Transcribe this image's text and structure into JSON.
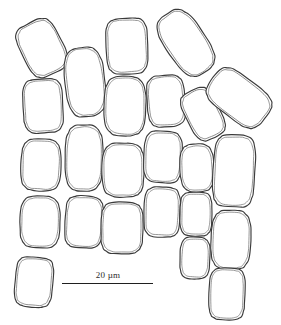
{
  "figure": {
    "kind": "line-drawing-micrograph",
    "background_color": "#ffffff",
    "outline_color": "#3a3a3a",
    "inner_outline_color": "#6e6e6e",
    "width_px": 281,
    "height_px": 325
  },
  "scalebar": {
    "label": "20 µm",
    "value": 20,
    "unit": "µm",
    "bar_length_px": 91,
    "line_color": "#1f1f1f"
  },
  "caption": {
    "left_fragment": "",
    "right_fragment": ""
  },
  "chart_data": {
    "type": "scatter",
    "title": "",
    "xlabel": "",
    "ylabel": "",
    "grid": false,
    "legend": null,
    "xlim": [
      0,
      281
    ],
    "ylim": [
      0,
      325
    ],
    "annotations": [
      "20 µm"
    ],
    "chains": [
      {
        "name": "chain-1",
        "cell_count": 5,
        "cells": [
          {
            "id": "c1-1",
            "cx": 42,
            "cy": 48,
            "rx": 21,
            "ry": 28,
            "rot": -26
          },
          {
            "id": "c1-2",
            "cx": 43,
            "cy": 106,
            "rx": 20,
            "ry": 27,
            "rot": -3
          },
          {
            "id": "c1-3",
            "cx": 41,
            "cy": 165,
            "rx": 20,
            "ry": 26,
            "rot": 2
          },
          {
            "id": "c1-4",
            "cx": 40,
            "cy": 222,
            "rx": 20,
            "ry": 26,
            "rot": 1
          },
          {
            "id": "c1-5",
            "cx": 34,
            "cy": 282,
            "rx": 19,
            "ry": 25,
            "rot": 5
          }
        ]
      },
      {
        "name": "chain-2",
        "cell_count": 3,
        "cells": [
          {
            "id": "c2-1",
            "cx": 85,
            "cy": 82,
            "rx": 20,
            "ry": 35,
            "rot": -6
          },
          {
            "id": "c2-2",
            "cx": 84,
            "cy": 158,
            "rx": 19,
            "ry": 33,
            "rot": 1
          },
          {
            "id": "c2-3",
            "cx": 84,
            "cy": 222,
            "rx": 19,
            "ry": 26,
            "rot": 3
          }
        ]
      },
      {
        "name": "chain-3",
        "cell_count": 4,
        "cells": [
          {
            "id": "c3-1",
            "cx": 127,
            "cy": 46,
            "rx": 21,
            "ry": 28,
            "rot": -2
          },
          {
            "id": "c3-2",
            "cx": 125,
            "cy": 106,
            "rx": 21,
            "ry": 30,
            "rot": 1
          },
          {
            "id": "c3-3",
            "cx": 123,
            "cy": 170,
            "rx": 21,
            "ry": 27,
            "rot": 0
          },
          {
            "id": "c3-4",
            "cx": 122,
            "cy": 228,
            "rx": 21,
            "ry": 26,
            "rot": 1
          }
        ]
      },
      {
        "name": "chain-4",
        "cell_count": 4,
        "cells": [
          {
            "id": "c4-1",
            "cx": 186,
            "cy": 43,
            "rx": 20,
            "ry": 35,
            "rot": -34
          },
          {
            "id": "c4-2",
            "cx": 166,
            "cy": 101,
            "rx": 19,
            "ry": 26,
            "rot": -4
          },
          {
            "id": "c4-3",
            "cx": 163,
            "cy": 157,
            "rx": 19,
            "ry": 26,
            "rot": 2
          },
          {
            "id": "c4-4",
            "cx": 162,
            "cy": 212,
            "rx": 18,
            "ry": 25,
            "rot": 2
          }
        ]
      },
      {
        "name": "chain-5",
        "cell_count": 4,
        "cells": [
          {
            "id": "c5-1",
            "cx": 203,
            "cy": 114,
            "rx": 17,
            "ry": 26,
            "rot": -27
          },
          {
            "id": "c5-2",
            "cx": 197,
            "cy": 168,
            "rx": 17,
            "ry": 24,
            "rot": -3
          },
          {
            "id": "c5-3",
            "cx": 196,
            "cy": 214,
            "rx": 16,
            "ry": 22,
            "rot": 1
          },
          {
            "id": "c5-4",
            "cx": 195,
            "cy": 258,
            "rx": 15,
            "ry": 21,
            "rot": 2
          }
        ]
      },
      {
        "name": "chain-6",
        "cell_count": 3,
        "cells": [
          {
            "id": "c6-1",
            "cx": 239,
            "cy": 98,
            "rx": 21,
            "ry": 33,
            "rot": -52
          },
          {
            "id": "c6-2",
            "cx": 234,
            "cy": 171,
            "rx": 21,
            "ry": 36,
            "rot": 3
          },
          {
            "id": "c6-3",
            "cx": 231,
            "cy": 240,
            "rx": 20,
            "ry": 30,
            "rot": 2
          },
          {
            "id": "c6-4",
            "cx": 227,
            "cy": 294,
            "rx": 18,
            "ry": 26,
            "rot": 2
          }
        ]
      }
    ]
  }
}
